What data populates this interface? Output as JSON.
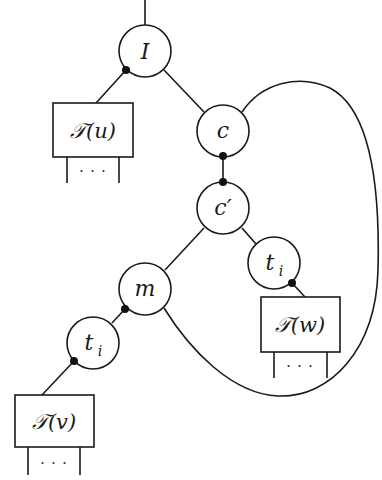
{
  "diagram": {
    "type": "tree-with-loop",
    "nodes": [
      {
        "id": "I",
        "label": "I",
        "shape": "circle",
        "cx": 145,
        "cy": 51
      },
      {
        "id": "c",
        "label": "c",
        "shape": "circle",
        "cx": 223,
        "cy": 131
      },
      {
        "id": "cprime",
        "label": "c′",
        "shape": "circle",
        "cx": 223,
        "cy": 208
      },
      {
        "id": "m",
        "label": "m",
        "shape": "circle",
        "cx": 145,
        "cy": 289
      },
      {
        "id": "ti_right",
        "label": "t",
        "sub": "i",
        "shape": "circle",
        "cx": 274,
        "cy": 263
      },
      {
        "id": "ti_left",
        "label": "t",
        "sub": "i",
        "shape": "circle",
        "cx": 93,
        "cy": 343
      },
      {
        "id": "Tu",
        "label": "𝒯(u)",
        "shape": "box",
        "x": 53,
        "y": 103,
        "w": 80,
        "h": 54,
        "children_label": "···"
      },
      {
        "id": "Tw",
        "label": "𝒯(w)",
        "shape": "box",
        "x": 261,
        "y": 297,
        "w": 79,
        "h": 55,
        "children_label": "···"
      },
      {
        "id": "Tv",
        "label": "𝒯(v)",
        "shape": "box",
        "x": 15,
        "y": 395,
        "w": 79,
        "h": 52,
        "children_label": "···"
      }
    ],
    "edges": [
      {
        "from": "root",
        "to": "I"
      },
      {
        "from": "I",
        "to": "Tu",
        "marked_end": "I"
      },
      {
        "from": "I",
        "to": "c"
      },
      {
        "from": "c",
        "to": "cprime",
        "marked_end": "both"
      },
      {
        "from": "cprime",
        "to": "m"
      },
      {
        "from": "cprime",
        "to": "ti_right"
      },
      {
        "from": "ti_right",
        "to": "Tw",
        "marked_end": "ti_right"
      },
      {
        "from": "m",
        "to": "ti_left",
        "marked_end": "m"
      },
      {
        "from": "ti_left",
        "to": "Tv",
        "marked_end": "ti_left"
      },
      {
        "from": "c",
        "to": "m",
        "kind": "loop-curve"
      }
    ],
    "labels": {
      "I": "I",
      "c": "c",
      "cprime": "c′",
      "m": "m",
      "t": "t",
      "i": "i",
      "Tu": "𝒯(u)",
      "Tw": "𝒯(w)",
      "Tv": "𝒯(v)",
      "ellipsis": "· · ·"
    }
  }
}
